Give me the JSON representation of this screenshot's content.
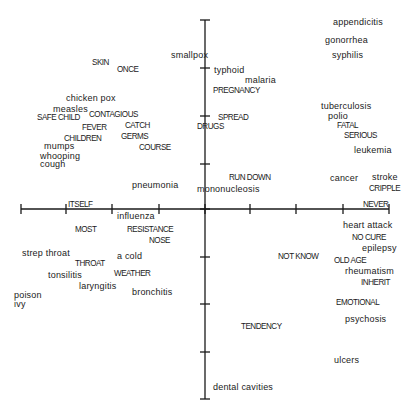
{
  "chart_data": {
    "type": "scatter",
    "title": "",
    "xlabel": "",
    "ylabel": "",
    "axes": {
      "origin_px": [
        205,
        209
      ],
      "x_axis": {
        "from_px": 21,
        "to_px": 389,
        "y_px": 209,
        "ticks_px": [
          21,
          66,
          112,
          159,
          205,
          250,
          296,
          343,
          389
        ]
      },
      "y_axis": {
        "from_px": 20,
        "to_px": 399,
        "x_px": 205,
        "ticks_px": [
          20,
          68,
          116,
          164,
          209,
          257,
          304,
          352,
          399
        ]
      },
      "grid": false,
      "tick_labels": false
    },
    "legend": "none",
    "points": [
      {
        "label": "appendicitis",
        "kind": "disease",
        "x": 333,
        "y": 22
      },
      {
        "label": "gonorrhea",
        "kind": "disease",
        "x": 325,
        "y": 40
      },
      {
        "label": "syphilis",
        "kind": "disease",
        "x": 332,
        "y": 55
      },
      {
        "label": "smallpox",
        "kind": "disease",
        "x": 171,
        "y": 55
      },
      {
        "label": "SKIN",
        "kind": "concept",
        "x": 92,
        "y": 62
      },
      {
        "label": "ONCE",
        "kind": "concept",
        "x": 117,
        "y": 69
      },
      {
        "label": "typhoid",
        "kind": "disease",
        "x": 214,
        "y": 70
      },
      {
        "label": "malaria",
        "kind": "disease",
        "x": 245,
        "y": 80
      },
      {
        "label": "PREGNANCY",
        "kind": "concept",
        "x": 213,
        "y": 90
      },
      {
        "label": "chicken pox",
        "kind": "disease",
        "x": 66,
        "y": 98
      },
      {
        "label": "measles",
        "kind": "disease",
        "x": 53,
        "y": 109
      },
      {
        "label": "CONTAGIOUS",
        "kind": "concept",
        "x": 89,
        "y": 114
      },
      {
        "label": "SAFE CHILD",
        "kind": "concept",
        "x": 37,
        "y": 117
      },
      {
        "label": "tuberculosis",
        "kind": "disease",
        "x": 321,
        "y": 106
      },
      {
        "label": "polio",
        "kind": "disease",
        "x": 328,
        "y": 116
      },
      {
        "label": "SPREAD",
        "kind": "concept",
        "x": 218,
        "y": 117
      },
      {
        "label": "CATCH",
        "kind": "concept",
        "x": 125,
        "y": 125
      },
      {
        "label": "FATAL",
        "kind": "concept",
        "x": 337,
        "y": 125
      },
      {
        "label": "DRUGS",
        "kind": "concept",
        "x": 197,
        "y": 126
      },
      {
        "label": "FEVER",
        "kind": "concept",
        "x": 82,
        "y": 127
      },
      {
        "label": "SERIOUS",
        "kind": "concept",
        "x": 344,
        "y": 135
      },
      {
        "label": "GERMS",
        "kind": "concept",
        "x": 121,
        "y": 136
      },
      {
        "label": "CHILDREN",
        "kind": "concept",
        "x": 64,
        "y": 138
      },
      {
        "label": "mumps",
        "kind": "disease",
        "x": 44,
        "y": 146
      },
      {
        "label": "COURSE",
        "kind": "concept",
        "x": 139,
        "y": 147
      },
      {
        "label": "leukemia",
        "kind": "disease",
        "x": 354,
        "y": 150
      },
      {
        "label": "whooping",
        "kind": "disease",
        "x": 40,
        "y": 156
      },
      {
        "label": "cough",
        "kind": "disease",
        "x": 40,
        "y": 164
      },
      {
        "label": "RUN DOWN",
        "kind": "concept",
        "x": 229,
        "y": 177
      },
      {
        "label": "cancer",
        "kind": "disease",
        "x": 330,
        "y": 178
      },
      {
        "label": "stroke",
        "kind": "disease",
        "x": 372,
        "y": 177
      },
      {
        "label": "pneumonia",
        "kind": "disease",
        "x": 132,
        "y": 185
      },
      {
        "label": "CRIPPLE",
        "kind": "concept",
        "x": 369,
        "y": 188
      },
      {
        "label": "mononucleosis",
        "kind": "disease",
        "x": 197,
        "y": 189
      },
      {
        "label": "ITSELF",
        "kind": "concept",
        "x": 68,
        "y": 204
      },
      {
        "label": "NEVER",
        "kind": "concept",
        "x": 363,
        "y": 204
      },
      {
        "label": "influenza",
        "kind": "disease",
        "x": 117,
        "y": 216
      },
      {
        "label": "heart  attack",
        "kind": "disease",
        "x": 343,
        "y": 225
      },
      {
        "label": "MOST",
        "kind": "concept",
        "x": 75,
        "y": 229
      },
      {
        "label": "RESISTANCE",
        "kind": "concept",
        "x": 127,
        "y": 229
      },
      {
        "label": "NO CURE",
        "kind": "concept",
        "x": 352,
        "y": 237
      },
      {
        "label": "NOSE",
        "kind": "concept",
        "x": 149,
        "y": 240
      },
      {
        "label": "epilepsy",
        "kind": "disease",
        "x": 362,
        "y": 248
      },
      {
        "label": "strep  throat",
        "kind": "disease",
        "x": 22,
        "y": 253
      },
      {
        "label": "a cold",
        "kind": "disease",
        "x": 117,
        "y": 256
      },
      {
        "label": "NOT KNOW",
        "kind": "concept",
        "x": 278,
        "y": 256
      },
      {
        "label": "OLD AGE",
        "kind": "concept",
        "x": 334,
        "y": 260
      },
      {
        "label": "THROAT",
        "kind": "concept",
        "x": 75,
        "y": 263
      },
      {
        "label": "rheumatism",
        "kind": "disease",
        "x": 345,
        "y": 271
      },
      {
        "label": "WEATHER",
        "kind": "concept",
        "x": 114,
        "y": 273
      },
      {
        "label": "tonsilitis",
        "kind": "disease",
        "x": 48,
        "y": 275
      },
      {
        "label": "INHERIT",
        "kind": "concept",
        "x": 361,
        "y": 282
      },
      {
        "label": "laryngitis",
        "kind": "disease",
        "x": 79,
        "y": 286
      },
      {
        "label": "bronchitis",
        "kind": "disease",
        "x": 132,
        "y": 292
      },
      {
        "label": "poison",
        "kind": "disease",
        "x": 14,
        "y": 295
      },
      {
        "label": "ivy",
        "kind": "disease",
        "x": 14,
        "y": 304
      },
      {
        "label": "EMOTIONAL",
        "kind": "concept",
        "x": 336,
        "y": 302
      },
      {
        "label": "psychosis",
        "kind": "disease",
        "x": 345,
        "y": 319
      },
      {
        "label": "TENDENCY",
        "kind": "concept",
        "x": 241,
        "y": 326
      },
      {
        "label": "ulcers",
        "kind": "disease",
        "x": 334,
        "y": 360
      },
      {
        "label": "dental  cavities",
        "kind": "disease",
        "x": 213,
        "y": 387
      }
    ]
  },
  "style": {
    "axis_color": "#1a1a1a",
    "text_color": "#1a1a1a",
    "background": "#ffffff"
  }
}
